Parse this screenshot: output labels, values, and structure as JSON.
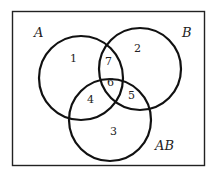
{
  "diagram": {
    "type": "venn",
    "sets": [
      {
        "id": "A",
        "label": "A"
      },
      {
        "id": "B",
        "label": "B"
      },
      {
        "id": "AB",
        "label": "AB"
      }
    ],
    "regions": [
      {
        "label": "1",
        "in": [
          "A"
        ]
      },
      {
        "label": "2",
        "in": [
          "B"
        ]
      },
      {
        "label": "3",
        "in": [
          "AB"
        ]
      },
      {
        "label": "4",
        "in": [
          "A",
          "AB"
        ]
      },
      {
        "label": "5",
        "in": [
          "B",
          "AB"
        ]
      },
      {
        "label": "6",
        "in": [
          "A",
          "B",
          "AB"
        ]
      },
      {
        "label": "7",
        "in": [
          "A",
          "B"
        ]
      }
    ],
    "colors": {
      "stroke": "#111111",
      "background": "#ffffff"
    }
  }
}
